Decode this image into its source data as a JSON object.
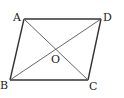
{
  "figure": {
    "type": "parallelogram-with-diagonals",
    "vertices": [
      {
        "label": "A",
        "x": 24,
        "y": 19
      },
      {
        "label": "D",
        "x": 101,
        "y": 19
      },
      {
        "label": "C",
        "x": 88,
        "y": 80
      },
      {
        "label": "B",
        "x": 10,
        "y": 80
      }
    ],
    "intersection": {
      "label": "O",
      "x": 55.5,
      "y": 49.5
    },
    "labels": {
      "A": "A",
      "B": "B",
      "C": "C",
      "D": "D",
      "O": "O"
    },
    "colors": {
      "edge": "#333333",
      "diagonal": "#555555",
      "text": "#222222",
      "background": "#ffffff"
    }
  }
}
